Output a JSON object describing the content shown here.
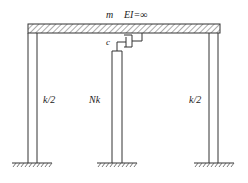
{
  "labels": {
    "mass": "m",
    "rigidity": "EI=∞",
    "damper": "c",
    "left_column": "k/2",
    "middle_column": "Nk",
    "right_column": "k/2"
  },
  "colors": {
    "line": "#333333",
    "background": "#ffffff"
  }
}
